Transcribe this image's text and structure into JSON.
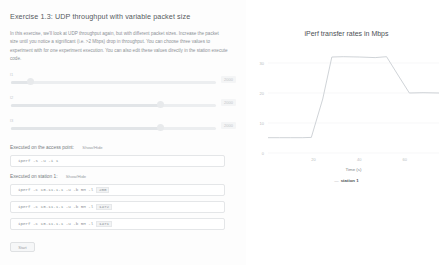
{
  "exercise": {
    "title": "Exercise 1.3: UDP throughput with variable packet size",
    "description": "In this exercise, we'll look at UDP throughput again, but with different packet sizes. Increase the packet size until you notice a significant (i.e. >2 Mbps) drop in throughput. You can choose three values to experiment with for one experiment execution. You can also edit these values directly in the station execute code."
  },
  "sliders": [
    {
      "label": "l1",
      "value": "200",
      "max_label": "2000",
      "fill_pct": 10
    },
    {
      "label": "l2",
      "value": "1472",
      "max_label": "2000",
      "fill_pct": 73
    },
    {
      "label": "l3",
      "value": "1471",
      "max_label": "2000",
      "fill_pct": 73
    }
  ],
  "access_point": {
    "exec_label": "Executed on the access point:",
    "toggle_label": "Show/Hide",
    "command": "iperf -s -u -i 1"
  },
  "station": {
    "exec_label": "Executed on station 1:",
    "toggle_label": "Show/Hide",
    "commands": [
      {
        "prefix": "iperf -c 10.11.1.1 -u -b 5M -l ",
        "tail": "200"
      },
      {
        "prefix": "iperf -c 10.11.1.1 -u -b 5M -l ",
        "tail": "1472"
      },
      {
        "prefix": "iperf -c 10.11.1.1 -u -b 5M -l ",
        "tail": "1471"
      }
    ]
  },
  "controls": {
    "start_label": "Start"
  },
  "chart_data": {
    "type": "line",
    "title": "iPerf transfer rates in Mbps",
    "xlabel": "Time (s)",
    "ylabel": "",
    "xlim": [
      0,
      75
    ],
    "ylim": [
      0,
      35
    ],
    "xticks": [
      "20",
      "40",
      "60"
    ],
    "xtick_values": [
      20,
      40,
      60
    ],
    "yticks": [
      "0",
      "10",
      "20",
      "30"
    ],
    "ytick_values": [
      0,
      10,
      20,
      30
    ],
    "grid": true,
    "legend_position": "bottom",
    "series": [
      {
        "name": "station 1",
        "color": "#c9ced3",
        "x": [
          0,
          5,
          10,
          15,
          19,
          24,
          28,
          33,
          40,
          47,
          52,
          57,
          62,
          68,
          75
        ],
        "y": [
          5.1,
          5.1,
          5.1,
          5.1,
          5.2,
          18.0,
          32.0,
          32.1,
          32.0,
          31.8,
          32.1,
          26.0,
          20.0,
          20.1,
          20.0
        ]
      }
    ]
  }
}
